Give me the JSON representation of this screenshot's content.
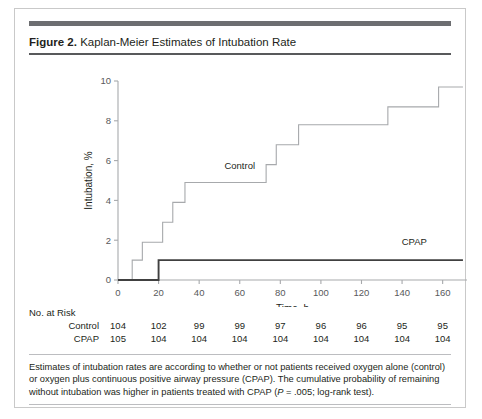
{
  "figure": {
    "label": "Figure 2.",
    "title": "Kaplan-Meier Estimates of Intubation Rate",
    "caption_part1": "Estimates of intubation rates are according to whether or not patients received oxygen alone (control) or oxygen plus continuous positive airway pressure (CPAP). The cumulative probability of remaining without intubation was higher in patients treated with CPAP (",
    "caption_italic": "P",
    "caption_part2": " = .005; log-rank test)."
  },
  "risk_table": {
    "heading": "No. at Risk",
    "rows": [
      {
        "label": "Control",
        "values": [
          "104",
          "102",
          "99",
          "99",
          "97",
          "96",
          "96",
          "95",
          "95"
        ]
      },
      {
        "label": "CPAP",
        "values": [
          "105",
          "104",
          "104",
          "104",
          "104",
          "104",
          "104",
          "104",
          "104"
        ]
      }
    ],
    "value_times": [
      0,
      20,
      40,
      60,
      80,
      100,
      120,
      140,
      160
    ]
  },
  "chart_data": {
    "type": "line",
    "subtype": "kaplan-meier-step",
    "title": "Kaplan-Meier Estimates of Intubation Rate",
    "xlabel": "Time, h",
    "ylabel": "Intubation, %",
    "xlim": [
      0,
      172
    ],
    "ylim": [
      0,
      10
    ],
    "xticks": [
      0,
      20,
      40,
      60,
      80,
      100,
      120,
      140,
      160
    ],
    "yticks": [
      0,
      2,
      4,
      6,
      8,
      10
    ],
    "grid": false,
    "legend": "inline-labels",
    "series": [
      {
        "name": "Control",
        "color": "#a7a9ac",
        "label_x": 60,
        "label_y": 5.6,
        "steps": [
          {
            "t": 0,
            "v": 0.0
          },
          {
            "t": 7,
            "v": 1.0
          },
          {
            "t": 12,
            "v": 1.9
          },
          {
            "t": 22,
            "v": 2.9
          },
          {
            "t": 27,
            "v": 3.9
          },
          {
            "t": 33,
            "v": 4.9
          },
          {
            "t": 73,
            "v": 5.8
          },
          {
            "t": 78,
            "v": 6.8
          },
          {
            "t": 89,
            "v": 7.8
          },
          {
            "t": 133,
            "v": 8.7
          },
          {
            "t": 158,
            "v": 9.7
          },
          {
            "t": 170,
            "v": 9.7
          }
        ]
      },
      {
        "name": "CPAP",
        "color": "#404040",
        "label_x": 146,
        "label_y": 1.75,
        "steps": [
          {
            "t": 0,
            "v": 0.0
          },
          {
            "t": 20,
            "v": 1.0
          },
          {
            "t": 170,
            "v": 1.0
          }
        ]
      }
    ]
  }
}
